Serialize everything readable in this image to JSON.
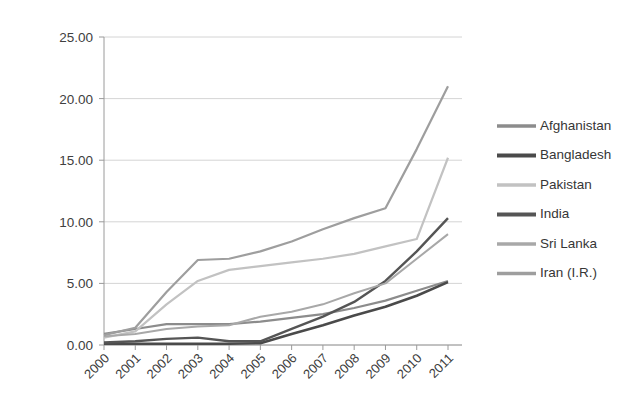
{
  "chart_data": {
    "type": "line",
    "title": "",
    "subtitle": "",
    "xlabel": "",
    "ylabel": "",
    "x": [
      2000,
      2001,
      2002,
      2003,
      2004,
      2005,
      2006,
      2007,
      2008,
      2009,
      2010,
      2011
    ],
    "categories": [
      "2000",
      "2001",
      "2002",
      "2003",
      "2004",
      "2005",
      "2006",
      "2007",
      "2008",
      "2009",
      "2010",
      "2011"
    ],
    "xtick_labels": [
      "2000",
      "2001",
      "2002",
      "2003",
      "2004",
      "2005",
      "2006",
      "2007",
      "2008",
      "2009",
      "2010",
      "2011"
    ],
    "ytick_labels": [
      "0.00",
      "5.00",
      "10.00",
      "15.00",
      "20.00",
      "25.00"
    ],
    "ytick_values": [
      0,
      5,
      10,
      15,
      20,
      25
    ],
    "ylim": [
      0,
      25
    ],
    "xlim": [
      2000,
      2011
    ],
    "grid": "horizontal",
    "legend_position": "right",
    "series": [
      {
        "name": "Afghanistan",
        "color": "#8c8c8c",
        "width": 2.2,
        "values": [
          0.9,
          1.3,
          1.7,
          1.7,
          1.7,
          1.9,
          2.2,
          2.5,
          3.0,
          3.6,
          4.4,
          5.2
        ]
      },
      {
        "name": "Bangladesh",
        "color": "#4a4a4a",
        "width": 2.6,
        "values": [
          0.1,
          0.1,
          0.1,
          0.1,
          0.1,
          0.15,
          0.9,
          1.6,
          2.4,
          3.1,
          4.0,
          5.1
        ]
      },
      {
        "name": "Pakistan",
        "color": "#c2c2c2",
        "width": 2.2,
        "values": [
          0.6,
          1.1,
          3.3,
          5.2,
          6.1,
          6.4,
          6.7,
          7.0,
          7.4,
          8.0,
          8.6,
          15.2
        ]
      },
      {
        "name": "India",
        "color": "#555555",
        "width": 2.4,
        "values": [
          0.2,
          0.3,
          0.5,
          0.6,
          0.3,
          0.3,
          1.3,
          2.3,
          3.5,
          5.2,
          7.6,
          10.3
        ]
      },
      {
        "name": "Sri Lanka",
        "color": "#a8a8a8",
        "width": 2.0,
        "values": [
          0.7,
          0.9,
          1.3,
          1.5,
          1.6,
          2.3,
          2.7,
          3.3,
          4.2,
          5.0,
          7.0,
          9.0
        ]
      },
      {
        "name": "Iran (I.R.)",
        "color": "#9e9e9e",
        "width": 2.2,
        "values": [
          0.8,
          1.4,
          4.3,
          6.9,
          7.0,
          7.6,
          8.4,
          9.4,
          10.3,
          11.1,
          15.9,
          21.0
        ]
      }
    ]
  },
  "legend": {
    "items": [
      {
        "label": "Afghanistan"
      },
      {
        "label": "Bangladesh"
      },
      {
        "label": "Pakistan"
      },
      {
        "label": "India"
      },
      {
        "label": "Sri Lanka"
      },
      {
        "label": "Iran (I.R.)"
      }
    ]
  },
  "colors": {
    "background": "#ffffff",
    "grid": "#c9c9c9",
    "axis": "#9a9a9a",
    "tick_text": "#404040",
    "legend_text": "#363636"
  }
}
